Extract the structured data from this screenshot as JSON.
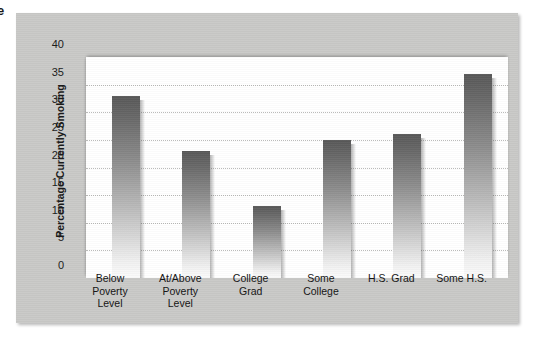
{
  "figure": {
    "edge_text": "e",
    "panel_color": "#c9c9c7",
    "plot_background": "#ffffff",
    "bar_color_top": "#585858",
    "bar_color_bottom": "#fbfbfb",
    "gridline_color": "#b9b9b7"
  },
  "chart_data": {
    "type": "bar",
    "title": "",
    "xlabel": "",
    "ylabel": "Percentage Currently Smoking",
    "categories": [
      "Below Poverty Level",
      "At/Above Poverty Level",
      "College Grad",
      "Some College",
      "H.S. Grad",
      "Some H.S."
    ],
    "category_lines": [
      [
        "Below",
        "Poverty",
        "Level"
      ],
      [
        "At/Above",
        "Poverty",
        "Level"
      ],
      [
        "College",
        "Grad"
      ],
      [
        "Some",
        "College"
      ],
      [
        "H.S. Grad"
      ],
      [
        "Some H.S."
      ]
    ],
    "values": [
      33,
      23,
      13,
      25,
      26,
      37
    ],
    "ylim": [
      0,
      40
    ],
    "ytick_labels": [
      "40",
      "35",
      "30",
      "25",
      "20",
      "15",
      "10",
      "5",
      "0"
    ],
    "ytick_values": [
      40,
      35,
      30,
      25,
      20,
      15,
      10,
      5,
      0
    ],
    "grid": true,
    "grid_axis": "y",
    "legend": "none"
  }
}
